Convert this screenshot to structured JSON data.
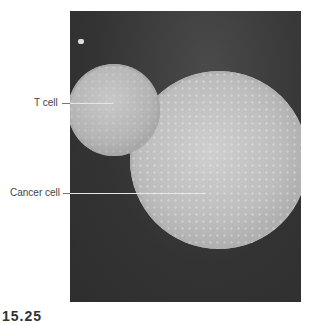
{
  "figure": {
    "image": "scanning electron micrograph of a T cell attacking a cancer cell",
    "labels": [
      {
        "text": "T cell"
      },
      {
        "text": "Cancer cell"
      }
    ],
    "figure_number": "15.25"
  }
}
